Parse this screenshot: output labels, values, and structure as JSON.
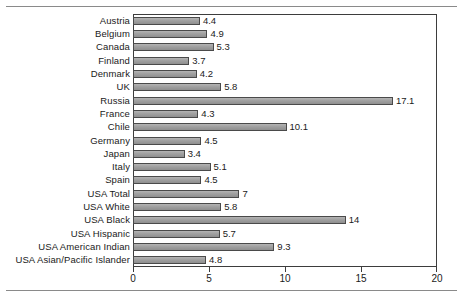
{
  "chart_data": {
    "type": "bar",
    "orientation": "horizontal",
    "title": "",
    "subtitle": "",
    "xlabel": "",
    "ylabel": "",
    "xlim": [
      0,
      20
    ],
    "xticks": [
      0,
      5,
      10,
      15,
      20
    ],
    "xtick_labels": [
      "0",
      "5",
      "10",
      "15",
      "20"
    ],
    "grid": false,
    "legend": null,
    "categories": [
      "Austria",
      "Belgium",
      "Canada",
      "Finland",
      "Denmark",
      "UK",
      "Russia",
      "France",
      "Chile",
      "Germany",
      "Japan",
      "Italy",
      "Spain",
      "USA Total",
      "USA White",
      "USA Black",
      "USA Hispanic",
      "USA American Indian",
      "USA Asian/Pacific Islander"
    ],
    "values": [
      4.4,
      4.9,
      5.3,
      3.7,
      4.2,
      5.8,
      17.1,
      4.3,
      10.1,
      4.5,
      3.4,
      5.1,
      4.5,
      7,
      5.8,
      14,
      5.7,
      9.3,
      4.8
    ],
    "value_labels": [
      "4.4",
      "4.9",
      "5.3",
      "3.7",
      "4.2",
      "5.8",
      "17.1",
      "4.3",
      "10.1",
      "4.5",
      "3.4",
      "5.1",
      "4.5",
      "7",
      "5.8",
      "14",
      "5.7",
      "9.3",
      "4.8"
    ],
    "colors": {
      "bar_fill": "#a2a2a2",
      "bar_stroke": "#4a4a4a",
      "axis": "#3d3d3d",
      "text": "#1a1a1a",
      "background": "#ffffff",
      "rule": "#8a8a8a"
    }
  }
}
